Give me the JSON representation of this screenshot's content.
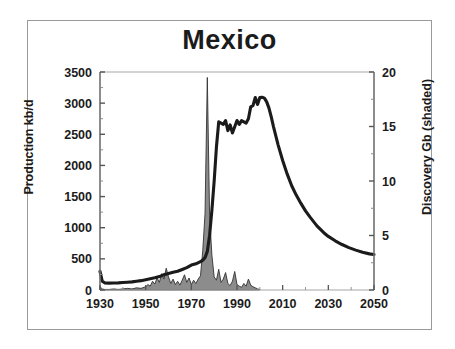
{
  "figure": {
    "title": "Mexico",
    "frame_color": "#9a9a9a",
    "background": "#ffffff",
    "curve_color": "#1b1b1b",
    "shade_fill": "#8c8c8c",
    "shade_stroke": "#333333"
  },
  "chart_data": {
    "type": "line",
    "title": "Mexico",
    "xlabel": "",
    "ylabel": "Production kb/d",
    "y2label": "Discovery Gb (shaded)",
    "xlim": [
      1930,
      2050
    ],
    "ylim": [
      0,
      3500
    ],
    "y2lim": [
      0,
      20
    ],
    "grid": false,
    "legend": "none",
    "xticks": [
      1930,
      1950,
      1970,
      1990,
      2010,
      2030,
      2050
    ],
    "xtick_labels": [
      "1930",
      "1950",
      "1970",
      "1990",
      "2010",
      "2030",
      "2050"
    ],
    "xminor_step": 10,
    "yticks": [
      0,
      500,
      1000,
      1500,
      2000,
      2500,
      3000,
      3500
    ],
    "ytick_labels": [
      "0",
      "500",
      "1000",
      "1500",
      "2000",
      "2500",
      "3000",
      "3500"
    ],
    "yminor_step": 250,
    "y2ticks": [
      0,
      5,
      10,
      15,
      20
    ],
    "y2tick_labels": [
      "0",
      "5",
      "10",
      "15",
      "20"
    ],
    "y2minor_step": 2.5,
    "series": [
      {
        "name": "Production kb/d",
        "axis": "left",
        "style": "thick-line",
        "color": "#1b1b1b",
        "x": [
          1930,
          1931,
          1932,
          1934,
          1936,
          1938,
          1940,
          1942,
          1944,
          1946,
          1948,
          1950,
          1952,
          1954,
          1956,
          1958,
          1960,
          1962,
          1964,
          1966,
          1968,
          1970,
          1972,
          1974,
          1975,
          1976,
          1977,
          1978,
          1979,
          1980,
          1981,
          1982,
          1983,
          1984,
          1985,
          1986,
          1987,
          1988,
          1989,
          1990,
          1991,
          1992,
          1993,
          1994,
          1995,
          1996,
          1997,
          1998,
          1999,
          2000,
          2001,
          2002,
          2003,
          2004,
          2005,
          2006,
          2008,
          2010,
          2012,
          2014,
          2016,
          2018,
          2020,
          2022,
          2025,
          2028,
          2030,
          2033,
          2036,
          2039,
          2042,
          2045,
          2048,
          2050
        ],
        "y": [
          300,
          140,
          115,
          110,
          112,
          115,
          120,
          125,
          130,
          140,
          150,
          165,
          180,
          195,
          215,
          245,
          265,
          285,
          300,
          330,
          360,
          400,
          420,
          455,
          480,
          520,
          620,
          880,
          1280,
          1750,
          2300,
          2700,
          2680,
          2660,
          2720,
          2560,
          2650,
          2520,
          2620,
          2720,
          2660,
          2720,
          2700,
          2680,
          2750,
          2940,
          2960,
          3090,
          2980,
          3090,
          3095,
          3080,
          3020,
          2920,
          2780,
          2620,
          2330,
          2080,
          1860,
          1670,
          1520,
          1390,
          1270,
          1170,
          1030,
          920,
          860,
          790,
          730,
          680,
          640,
          605,
          580,
          570
        ]
      },
      {
        "name": "Discovery Gb (shaded)",
        "axis": "right",
        "style": "shaded-area",
        "fill": "#8c8c8c",
        "x": [
          1930,
          1931,
          1932,
          1934,
          1936,
          1938,
          1940,
          1942,
          1944,
          1946,
          1948,
          1950,
          1951,
          1952,
          1953,
          1954,
          1955,
          1956,
          1957,
          1958,
          1959,
          1960,
          1961,
          1962,
          1963,
          1964,
          1965,
          1966,
          1967,
          1968,
          1969,
          1970,
          1971,
          1972,
          1973,
          1974,
          1975,
          1976,
          1977,
          1978,
          1979,
          1980,
          1981,
          1982,
          1983,
          1984,
          1985,
          1986,
          1987,
          1988,
          1989,
          1990,
          1991,
          1992,
          1993,
          1994,
          1995,
          1996,
          1997,
          1998,
          1999,
          2000
        ],
        "y": [
          0.3,
          0.1,
          0.05,
          0.05,
          0.1,
          0.05,
          0.1,
          0.15,
          0.1,
          0.2,
          0.15,
          0.3,
          0.5,
          0.35,
          0.8,
          0.55,
          1.1,
          0.7,
          1.5,
          1.0,
          2.0,
          1.2,
          0.6,
          1.0,
          0.5,
          0.8,
          0.45,
          0.9,
          1.4,
          0.7,
          1.1,
          0.5,
          0.9,
          0.6,
          1.0,
          1.3,
          3.6,
          7.0,
          19.5,
          6.8,
          3.2,
          1.2,
          0.9,
          1.9,
          0.7,
          1.0,
          1.6,
          0.6,
          0.4,
          0.8,
          1.7,
          0.5,
          0.35,
          0.25,
          0.6,
          0.35,
          1.0,
          0.45,
          0.3,
          0.2,
          0.1,
          0.05
        ]
      }
    ],
    "annotations": [
      {
        "text": "Production spike 1959",
        "x": 1959,
        "y": 530
      },
      {
        "text": "Discovery mega-spike 1977",
        "x": 1977,
        "y2": 19.5
      },
      {
        "text": "Production peak ~3100 kb/d around 2000",
        "x": 2000,
        "y": 3095
      }
    ]
  }
}
